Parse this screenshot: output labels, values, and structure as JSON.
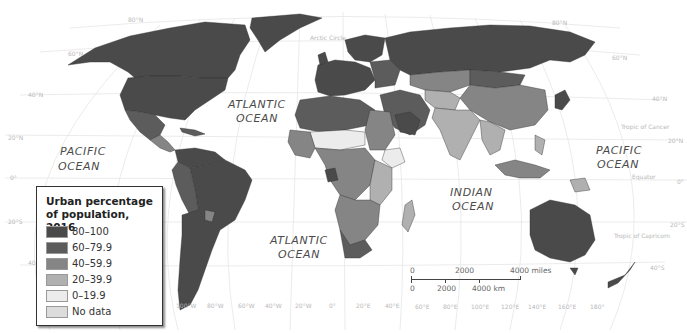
{
  "legend": {
    "title_line1": "Urban percentage",
    "title_line2": "of population, 2016",
    "items": [
      {
        "label": "80–100",
        "color": "#4a4a4a"
      },
      {
        "label": "60–79.9",
        "color": "#5c5c5c"
      },
      {
        "label": "40–59.9",
        "color": "#858585"
      },
      {
        "label": "20–39.9",
        "color": "#b0b0b0"
      },
      {
        "label": "0–19.9",
        "color": "#ececec"
      },
      {
        "label": "No data",
        "color": "#dcdcdc"
      }
    ]
  },
  "oceans": {
    "pacific_west": [
      "PACIFIC",
      "OCEAN"
    ],
    "atlantic_north": [
      "ATLANTIC",
      "OCEAN"
    ],
    "atlantic_south": [
      "ATLANTIC",
      "OCEAN"
    ],
    "indian": [
      "INDIAN",
      "OCEAN"
    ],
    "pacific_east": [
      "PACIFIC",
      "OCEAN"
    ]
  },
  "reference_lines": {
    "arctic_circle": "Arctic Circle",
    "tropic_of_cancer": "Tropic of Cancer",
    "equator": "Equator",
    "tropic_of_capricorn": "Tropic of Capricorn"
  },
  "latitudes_left": [
    "80°N",
    "60°N",
    "40°N",
    "20°N",
    "0°",
    "20°S",
    "40°S"
  ],
  "latitudes_right": [
    "80°N",
    "60°N",
    "40°N",
    "20°N",
    "0°",
    "20°S",
    "40°S"
  ],
  "longitudes": [
    "100°W",
    "80°W",
    "60°W",
    "40°W",
    "20°W",
    "0°",
    "20°E",
    "40°E",
    "60°E",
    "80°E",
    "100°E",
    "120°E",
    "140°E",
    "160°E",
    "180°"
  ],
  "scale_bar": {
    "miles": [
      "0",
      "2000",
      "4000 miles"
    ],
    "km": [
      "0",
      "2000",
      "4000 km"
    ]
  }
}
